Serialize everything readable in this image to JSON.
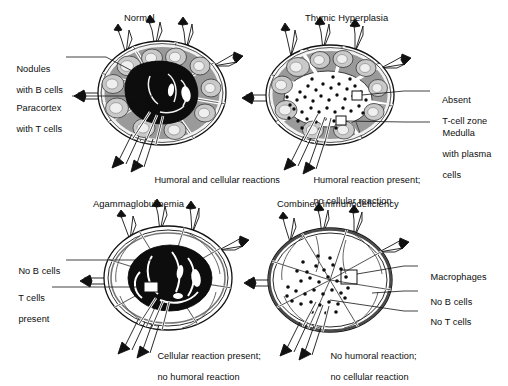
{
  "figure": {
    "kind": "medical-illustration",
    "background_color": "#ffffff",
    "ink_color": "#111111",
    "cortex_color": "#9a9a9a",
    "nodule_color": "#d9d9d9",
    "paracortex_color": "#0d0d0d",
    "medulla_color": "#ffffff",
    "capsule_color": "#808080"
  },
  "panels": [
    {
      "id": "normal",
      "title": "Normal",
      "title_x": 124,
      "title_y": 13,
      "node": {
        "cx": 162,
        "cy": 93,
        "rx": 64,
        "ry": 52,
        "cortex": true,
        "nodules": true,
        "paracortex": "dark",
        "medulla_dots": 0,
        "callout_boxes": 0
      },
      "labels": [
        {
          "name": "nodules-with-b-cells",
          "lines": [
            "Nodules",
            "with B cells"
          ],
          "x": 6,
          "y": 53,
          "leader": "M 66 57 L 106 57 L 136 73"
        },
        {
          "name": "paracortex-with-t-cells",
          "lines": [
            "Paracortex",
            "with T cells"
          ],
          "x": 6,
          "y": 92,
          "leader": "M 72 96 L 152 96"
        }
      ],
      "caption": {
        "lines": [
          "Humoral and cellular reactions"
        ],
        "x": 144,
        "y": 164
      }
    },
    {
      "id": "thymic-hyperplasia",
      "title": "Thymic Hyperplasia",
      "title_x": 305,
      "title_y": 13,
      "node": {
        "cx": 330,
        "cy": 95,
        "rx": 64,
        "ry": 50,
        "cortex": true,
        "nodules": true,
        "paracortex": "absent",
        "medulla_dots": 46,
        "callout_boxes": 2
      },
      "labels": [
        {
          "name": "absent-t-cell-zone",
          "lines": [
            "Absent",
            "T-cell zone"
          ],
          "x": 432,
          "y": 84,
          "leader": "M 340 97 L 400 91 L 430 91"
        },
        {
          "name": "medulla-with-plasma-cells",
          "lines": [
            "Medulla",
            "with plasma",
            "cells"
          ],
          "x": 432,
          "y": 117,
          "leader": "M 326 119 L 400 122 L 430 122"
        }
      ],
      "caption": {
        "lines": [
          "Humoral reaction present;",
          "no cellular reaction"
        ],
        "x": 303,
        "y": 164
      }
    },
    {
      "id": "agammaglobulinemia",
      "title": "Agammaglobulinemia",
      "title_x": 93,
      "title_y": 199,
      "node": {
        "cx": 168,
        "cy": 278,
        "rx": 64,
        "ry": 52,
        "cortex": false,
        "nodules": false,
        "paracortex": "dark",
        "medulla_dots": 0,
        "callout_boxes": 1
      },
      "labels": [
        {
          "name": "no-b-cells",
          "lines": [
            "No B cells"
          ],
          "x": 8,
          "y": 256,
          "leader": "M 66 260 L 152 260"
        },
        {
          "name": "t-cells-present",
          "lines": [
            "T cells",
            "present"
          ],
          "x": 8,
          "y": 283,
          "leader": "M 52 287 L 150 287"
        }
      ],
      "caption": {
        "lines": [
          "Cellular reaction present;",
          "no humoral reaction"
        ],
        "x": 147,
        "y": 340
      }
    },
    {
      "id": "combined-immunodeficiency",
      "title": "Combined immunodeficiency",
      "title_x": 277,
      "title_y": 199,
      "node": {
        "cx": 330,
        "cy": 280,
        "rx": 62,
        "ry": 52,
        "cortex": false,
        "nodules": false,
        "paracortex": "absent",
        "medulla_dots": 34,
        "callout_boxes": 1
      },
      "labels": [
        {
          "name": "macrophages",
          "lines": [
            "Macrophages"
          ],
          "x": 420,
          "y": 262,
          "leader": "M 352 277 L 404 266 L 418 266"
        },
        {
          "name": "no-b-cells",
          "lines": [
            "No B cells"
          ],
          "x": 420,
          "y": 287,
          "leader": "M 366 293 L 404 291 L 418 291"
        },
        {
          "name": "no-t-cells",
          "lines": [
            "No T cells"
          ],
          "x": 420,
          "y": 307,
          "leader": "M 330 296 L 404 311 L 418 311"
        }
      ],
      "caption": {
        "lines": [
          "No humoral reaction;",
          "no cellular reaction"
        ],
        "x": 320,
        "y": 340
      }
    }
  ],
  "figure_caption": {
    "visible": false,
    "note": "cropped at bottom edge"
  }
}
